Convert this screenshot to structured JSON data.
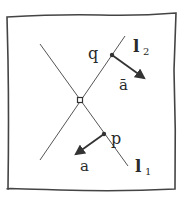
{
  "diagram": {
    "frame": {
      "x1": 7,
      "y1": 16,
      "x2": 176,
      "y2": 190
    },
    "lines": [
      {
        "id": "l1",
        "label": "l",
        "subscript": "1",
        "from": [
          40,
          44
        ],
        "to": [
          128,
          166
        ]
      },
      {
        "id": "l2",
        "label": "l",
        "subscript": "2",
        "from": [
          40,
          160
        ],
        "to": [
          125,
          36
        ]
      }
    ],
    "intersection": [
      80,
      100
    ],
    "points": [
      {
        "id": "q",
        "label": "q",
        "at": [
          112,
          55
        ],
        "on": "l2"
      },
      {
        "id": "p",
        "label": "p",
        "at": [
          104,
          134
        ],
        "on": "l1"
      }
    ],
    "vectors": [
      {
        "id": "a_bar",
        "label": "ā",
        "from": [
          112,
          55
        ],
        "to": [
          145,
          79
        ]
      },
      {
        "id": "a",
        "label": "a",
        "from": [
          104,
          134
        ],
        "to": [
          75,
          155
        ]
      }
    ],
    "labels": {
      "l1_main": "l",
      "l1_sub": "1",
      "l2_main": "l",
      "l2_sub": "2",
      "q": "q",
      "p": "p",
      "a_bar": "ā",
      "a": "a"
    },
    "colors": {
      "stroke": "#333333",
      "background": "#ffffff"
    }
  }
}
